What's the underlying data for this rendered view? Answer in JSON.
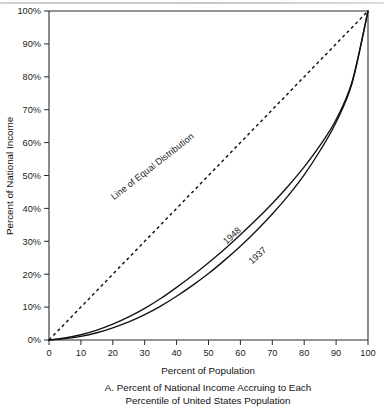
{
  "figure": {
    "caption_line1": "A. Percent of National Income Accruing to Each",
    "caption_line2": "Percentile of United States Population"
  },
  "chart_data": {
    "type": "line",
    "title": "",
    "xlabel": "Percent of Population",
    "ylabel": "Percent of National Income",
    "xlim": [
      0,
      100
    ],
    "ylim": [
      0,
      100
    ],
    "grid": false,
    "legend_position": "inline-annotations",
    "x_tick_labels": [
      "0",
      "10",
      "20",
      "30",
      "40",
      "50",
      "60",
      "70",
      "80",
      "90",
      "100"
    ],
    "x_ticks": [
      0,
      10,
      20,
      30,
      40,
      50,
      60,
      70,
      80,
      90,
      100
    ],
    "y_tick_labels": [
      "0%",
      "10%",
      "20%",
      "30%",
      "40%",
      "50%",
      "60%",
      "70%",
      "80%",
      "90%",
      "100%"
    ],
    "y_ticks": [
      0,
      10,
      20,
      30,
      40,
      50,
      60,
      70,
      80,
      90,
      100
    ],
    "x": [
      0,
      5,
      10,
      15,
      20,
      25,
      30,
      35,
      40,
      45,
      50,
      55,
      60,
      65,
      70,
      75,
      80,
      85,
      90,
      95,
      100
    ],
    "series": [
      {
        "name": "Line of Equal Distribution",
        "style": "dashed",
        "label": "Line of Equal Distribution",
        "label_rotation": -38,
        "values": [
          0,
          5,
          10,
          15,
          20,
          25,
          30,
          35,
          40,
          45,
          50,
          55,
          60,
          65,
          70,
          75,
          80,
          85,
          90,
          95,
          100
        ]
      },
      {
        "name": "1948",
        "style": "solid",
        "label": "1948",
        "label_rotation": -42,
        "values": [
          0,
          0.6,
          1.6,
          3.0,
          4.8,
          7.0,
          9.6,
          12.6,
          16.0,
          19.6,
          23.5,
          27.6,
          32.0,
          36.6,
          41.5,
          46.8,
          52.6,
          59.2,
          67.0,
          78.5,
          100
        ]
      },
      {
        "name": "1937",
        "style": "solid",
        "label": "1937",
        "label_rotation": -42,
        "values": [
          0,
          0.4,
          1.1,
          2.2,
          3.7,
          5.5,
          7.7,
          10.3,
          13.3,
          16.6,
          20.2,
          24.2,
          28.5,
          33.2,
          38.3,
          43.9,
          50.2,
          57.6,
          66.2,
          78.0,
          100
        ]
      }
    ],
    "annotations": [
      {
        "text": "Line of Equal Distribution",
        "x": 33,
        "y": 52
      },
      {
        "text": "1948",
        "x": 58,
        "y": 31
      },
      {
        "text": "1937",
        "x": 66,
        "y": 25
      }
    ]
  }
}
